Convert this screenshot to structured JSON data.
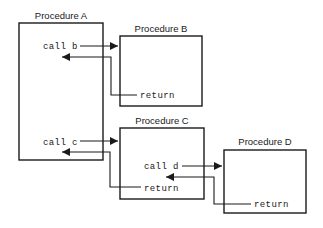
{
  "diagram": {
    "colors": {
      "background": "#ffffff",
      "stroke": "#1a1a1a",
      "text": "#1a1a1a",
      "box_fill": "#ffffff"
    },
    "procedures": [
      {
        "id": "a",
        "label": "Procedure A",
        "box": {
          "x": 19,
          "y": 23,
          "w": 84,
          "h": 137
        },
        "label_pos": {
          "x": 61,
          "y": 19
        },
        "statements": [
          {
            "id": "call-b",
            "text": "call b",
            "x": 43,
            "y": 49
          },
          {
            "id": "call-c",
            "text": "call c",
            "x": 43,
            "y": 145
          }
        ]
      },
      {
        "id": "b",
        "label": "Procedure B",
        "box": {
          "x": 120,
          "y": 36,
          "w": 82,
          "h": 70
        },
        "label_pos": {
          "x": 161,
          "y": 32
        },
        "statements": [
          {
            "id": "return-b",
            "text": "return",
            "x": 140,
            "y": 98
          }
        ]
      },
      {
        "id": "c",
        "label": "Procedure C",
        "box": {
          "x": 120,
          "y": 128,
          "w": 84,
          "h": 71
        },
        "label_pos": {
          "x": 162,
          "y": 124
        },
        "statements": [
          {
            "id": "call-d",
            "text": "call d",
            "x": 144,
            "y": 169
          },
          {
            "id": "return-c",
            "text": "return",
            "x": 144,
            "y": 191
          }
        ]
      },
      {
        "id": "d",
        "label": "Procedure D",
        "box": {
          "x": 224,
          "y": 150,
          "w": 82,
          "h": 63
        },
        "label_pos": {
          "x": 265,
          "y": 145
        },
        "statements": [
          {
            "id": "return-d",
            "text": "return",
            "x": 254,
            "y": 207
          }
        ]
      }
    ],
    "flows": [
      {
        "id": "call-b-arrow",
        "kind": "call",
        "from": "a.call-b",
        "to": "b",
        "path": "M 80 46 L 118 46",
        "arrow": {
          "x": 118,
          "y": 46,
          "dir": "right"
        }
      },
      {
        "id": "return-b-arrow",
        "kind": "return",
        "from": "b.return-b",
        "to": "a",
        "path": "M 137 95 L 111 95 L 111 57 L 62 57",
        "arrow": {
          "x": 62,
          "y": 57,
          "dir": "left"
        }
      },
      {
        "id": "call-c-arrow",
        "kind": "call",
        "from": "a.call-c",
        "to": "c",
        "path": "M 80 141 L 118 141",
        "arrow": {
          "x": 118,
          "y": 141,
          "dir": "right"
        }
      },
      {
        "id": "return-c-arrow",
        "kind": "return",
        "from": "c.return-c",
        "to": "a",
        "path": "M 141 187 L 110 187 L 110 152 L 62 152",
        "arrow": {
          "x": 62,
          "y": 152,
          "dir": "left"
        }
      },
      {
        "id": "call-d-arrow",
        "kind": "call",
        "from": "c.call-d",
        "to": "d",
        "path": "M 182 166 L 222 166",
        "arrow": {
          "x": 222,
          "y": 166,
          "dir": "right"
        }
      },
      {
        "id": "return-d-arrow",
        "kind": "return",
        "from": "d.return-d",
        "to": "c",
        "path": "M 251 204 L 214 204 L 214 177 L 166 177",
        "arrow": {
          "x": 166,
          "y": 177,
          "dir": "left"
        }
      }
    ]
  }
}
